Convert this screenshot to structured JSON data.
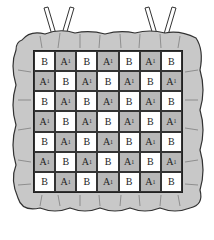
{
  "diagram": {
    "title": "",
    "colors": {
      "ruffle": "#c8c8c8",
      "A1": "#b8b8b8",
      "B": "#ffffff",
      "outline": "#333333"
    },
    "rows": [
      [
        "B",
        "A1",
        "B",
        "A1",
        "B",
        "A1",
        "B"
      ],
      [
        "A1",
        "B",
        "A1",
        "B",
        "A1",
        "B",
        "A1"
      ],
      [
        "B",
        "A1",
        "B",
        "A1",
        "B",
        "A1",
        "B"
      ],
      [
        "A1",
        "B",
        "A1",
        "B",
        "A1",
        "B",
        "A1"
      ],
      [
        "B",
        "A1",
        "B",
        "A1",
        "B",
        "A1",
        "B"
      ],
      [
        "A1",
        "B",
        "A1",
        "B",
        "A1",
        "B",
        "A1"
      ],
      [
        "B",
        "A1",
        "B",
        "A1",
        "B",
        "A1",
        "B"
      ]
    ]
  }
}
